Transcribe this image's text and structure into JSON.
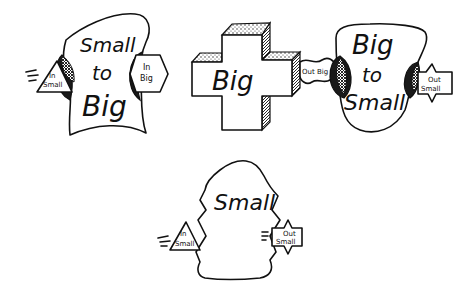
{
  "diagram": {
    "nodes": [
      {
        "id": "small-to-big",
        "label_lines": [
          "Small",
          "to",
          "Big"
        ],
        "shape": "blob"
      },
      {
        "id": "big",
        "label_lines": [
          "Big"
        ],
        "shape": "3d-cross"
      },
      {
        "id": "big-to-small",
        "label_lines": [
          "Big",
          "to",
          "Small"
        ],
        "shape": "blob"
      },
      {
        "id": "small",
        "label_lines": [
          "Small"
        ],
        "shape": "blob"
      }
    ],
    "ports": [
      {
        "id": "stb-in",
        "parent": "small-to-big",
        "label_lines": [
          "In",
          "Small"
        ],
        "shape": "triangle"
      },
      {
        "id": "stb-out",
        "parent": "small-to-big",
        "label_lines": [
          "In",
          "Big"
        ],
        "shape": "hexagon"
      },
      {
        "id": "big-out",
        "parent": "big",
        "label_lines": [
          "Out Big"
        ],
        "shape": "wavy"
      },
      {
        "id": "bts-out",
        "parent": "big-to-small",
        "label_lines": [
          "Out",
          "Small"
        ],
        "shape": "star-box"
      },
      {
        "id": "small-in",
        "parent": "small",
        "label_lines": [
          "In",
          "Small"
        ],
        "shape": "triangle"
      },
      {
        "id": "small-out",
        "parent": "small",
        "label_lines": [
          "Out",
          "Small"
        ],
        "shape": "star-box"
      }
    ]
  }
}
